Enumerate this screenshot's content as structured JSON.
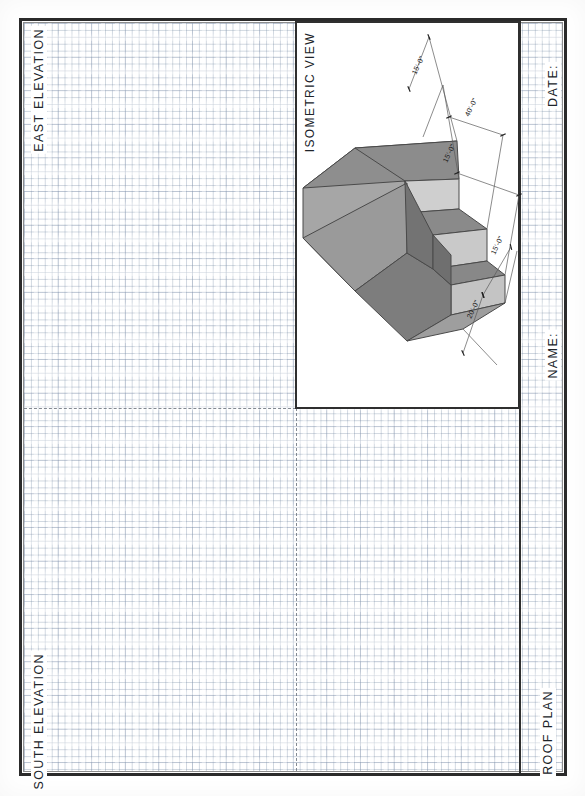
{
  "sheet": {
    "type": "architectural-drawing-sheet",
    "orientation": "portrait",
    "background": "graph-paper-grid",
    "border_color": "#2b2b2b",
    "grid_color": "#8c9bb4"
  },
  "panels": {
    "east_elevation": {
      "label": "EAST ELEVATION",
      "content": "blank"
    },
    "south_elevation": {
      "label": "SOUTH ELEVATION",
      "content": "blank"
    },
    "roof_plan": {
      "label": "ROOF PLAN",
      "content": "blank"
    },
    "isometric_view": {
      "label": "ISOMETRIC  VIEW",
      "content": "stepped massing solid",
      "border_color": "#2f2f2f"
    }
  },
  "titleblock": {
    "date_label": "DATE:",
    "name_label": "NAME:",
    "date_value": "",
    "name_value": ""
  },
  "isometric": {
    "description": "Three-step stepped rectangular massing shown in isometric projection with dimension strings",
    "face_colors": {
      "top": "#8f8f8f",
      "left": "#a4a4a4",
      "front": "#7f7f7f",
      "riser": "#b4b4b4",
      "shadow": "#6e6e6e"
    },
    "dimensions": [
      {
        "id": "dim-1",
        "text": "15'-0\""
      },
      {
        "id": "dim-2",
        "text": "40'-0\""
      },
      {
        "id": "dim-3",
        "text": "15'-0\""
      },
      {
        "id": "dim-4",
        "text": "15'-0\""
      },
      {
        "id": "dim-5",
        "text": "20'-0\""
      }
    ]
  }
}
